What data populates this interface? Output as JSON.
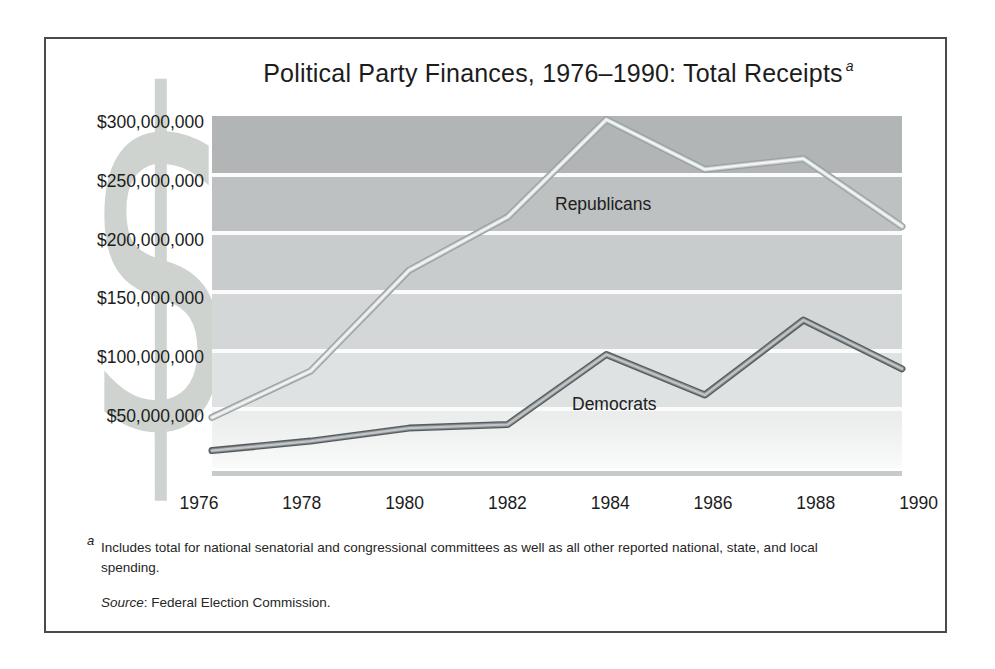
{
  "title": {
    "text": "Political Party Finances, 1976–1990: Total Receipts",
    "superscript": "a"
  },
  "watermark": {
    "glyph": "$",
    "color": "#ced3cf"
  },
  "chart_data": {
    "type": "line",
    "x": [
      1976,
      1978,
      1980,
      1982,
      1984,
      1986,
      1988,
      1990
    ],
    "series": [
      {
        "name": "Republicans",
        "values_usd_millions": [
          46,
          85,
          170,
          215,
          297,
          255,
          264,
          207
        ]
      },
      {
        "name": "Democrats",
        "values_usd_millions": [
          18,
          26,
          37,
          40,
          99,
          65,
          128,
          87
        ]
      }
    ],
    "title": "Political Party Finances, 1976–1990: Total Receipts",
    "xlabel": "",
    "ylabel": "",
    "ylim_usd": [
      0,
      300000000
    ],
    "ytick_labels": [
      "$300,000,000",
      "$250,000,000",
      "$200,000,000",
      "$150,000,000",
      "$100,000,000",
      "$50,000,000"
    ],
    "xtick_labels": [
      "1976",
      "1978",
      "1980",
      "1982",
      "1984",
      "1986",
      "1988",
      "1990"
    ],
    "grid": "white horizontal gridlines every $50,000,000 over shaded gray bands",
    "legend_position": "inline labels next to lines"
  },
  "series_labels": {
    "republicans": "Republicans",
    "democrats": "Democrats"
  },
  "footnote": {
    "marker": "a",
    "text": "Includes total for national senatorial and congressional committees as well as all other reported national, state, and local spending."
  },
  "source": {
    "label": "Source",
    "text": ": Federal Election Commission."
  },
  "style": {
    "band_colors": [
      "#b1b5b5",
      "#bdc1c1",
      "#c8cccc",
      "#d4d7d7",
      "#dfe2e2",
      "#eaedec"
    ],
    "gridline_color": "#fafbfa",
    "baseline_color": "#c6caca",
    "text_color": "#1c1c1c",
    "series_styles": [
      {
        "strokes": [
          {
            "c": "#9ba1a3",
            "w": 7.0
          },
          {
            "c": "#ccd0d0",
            "w": 4.4
          },
          {
            "c": "#f3f5f5",
            "w": 2.2
          }
        ]
      },
      {
        "strokes": [
          {
            "c": "#575d5f",
            "w": 7.0
          },
          {
            "c": "#8a8f91",
            "w": 4.4
          },
          {
            "c": "#c2c6c8",
            "w": 2.2
          }
        ]
      }
    ]
  }
}
